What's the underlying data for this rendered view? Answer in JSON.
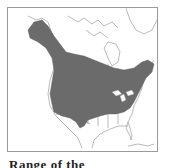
{
  "map": {
    "title": "North America range map",
    "colors": {
      "range_fill": "#6b6b6b",
      "border_line": "#8c8c8c",
      "land": "#ffffff",
      "frame": "#9a9a9a"
    },
    "shaded_region": "breeding/resident range across Alaska, Canada and northern/central United States"
  },
  "caption": {
    "text": "Range of the"
  }
}
